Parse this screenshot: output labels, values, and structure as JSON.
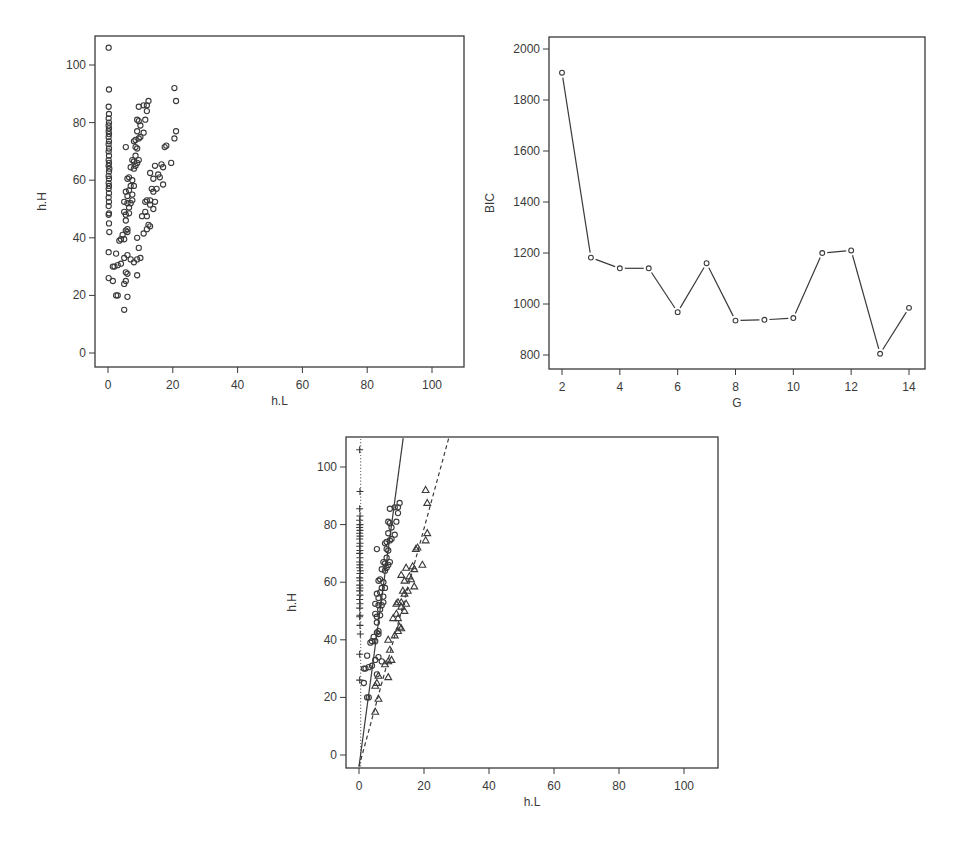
{
  "chart_data": [
    {
      "id": "scatter_raw",
      "type": "scatter",
      "title": "",
      "xlabel": "h.L",
      "ylabel": "h.H",
      "xlim": [
        -3,
        110
      ],
      "ylim": [
        -5,
        110
      ],
      "xticks": [
        0,
        20,
        40,
        60,
        80,
        100
      ],
      "yticks": [
        0,
        20,
        40,
        60,
        80,
        100
      ],
      "grid": false,
      "marker": "circle",
      "points_ref": "clusters"
    },
    {
      "id": "bic_curve",
      "type": "line",
      "title": "",
      "xlabel": "G",
      "ylabel": "BIC",
      "xlim": [
        1.6,
        14.5
      ],
      "ylim": [
        750,
        2050
      ],
      "xticks": [
        2,
        4,
        6,
        8,
        10,
        12,
        14
      ],
      "yticks": [
        800,
        1000,
        1200,
        1400,
        1600,
        1800,
        2000
      ],
      "grid": false,
      "marker": "circle",
      "x": [
        2,
        3,
        4,
        5,
        6,
        7,
        8,
        9,
        10,
        11,
        12,
        13,
        14
      ],
      "values": [
        1907,
        1182,
        1140,
        1140,
        968,
        1160,
        935,
        938,
        945,
        1200,
        1210,
        805,
        985
      ]
    },
    {
      "id": "scatter_clustered",
      "type": "scatter",
      "title": "",
      "xlabel": "h.L",
      "ylabel": "h.H",
      "xlim": [
        -3,
        110
      ],
      "ylim": [
        -5,
        110
      ],
      "xticks": [
        0,
        20,
        40,
        60,
        80,
        100
      ],
      "yticks": [
        0,
        20,
        40,
        60,
        80,
        100
      ],
      "grid": false,
      "series": [
        {
          "name": "cluster 1",
          "marker": "plus",
          "line": {
            "style": "dotted",
            "from": [
              0.5,
              -4
            ],
            "to": [
              0.5,
              110
            ]
          }
        },
        {
          "name": "cluster 2",
          "marker": "circle",
          "line": {
            "style": "solid",
            "from": [
              0,
              -4
            ],
            "to": [
              13.6,
              110
            ]
          }
        },
        {
          "name": "cluster 3",
          "marker": "triangle",
          "line": {
            "style": "dashed",
            "from": [
              0,
              -4
            ],
            "to": [
              27.6,
              110
            ]
          }
        }
      ],
      "points_ref": "clusters"
    }
  ],
  "clusters": {
    "plus": [
      [
        0.2,
        106
      ],
      [
        0.3,
        91.5
      ],
      [
        0.2,
        85.5
      ],
      [
        0.3,
        83
      ],
      [
        0.2,
        81.5
      ],
      [
        0.3,
        80
      ],
      [
        0.2,
        79
      ],
      [
        0.3,
        78
      ],
      [
        0.2,
        77
      ],
      [
        0.3,
        76
      ],
      [
        0.2,
        75
      ],
      [
        0.3,
        73.5
      ],
      [
        0.2,
        72.5
      ],
      [
        0.3,
        71
      ],
      [
        0.2,
        70
      ],
      [
        0.3,
        68.5
      ],
      [
        0.2,
        67
      ],
      [
        0.3,
        66
      ],
      [
        0.2,
        65
      ],
      [
        0.4,
        64
      ],
      [
        0.3,
        63
      ],
      [
        0.2,
        61.5
      ],
      [
        0.3,
        60.5
      ],
      [
        0.2,
        59
      ],
      [
        0.3,
        58
      ],
      [
        0.2,
        57
      ],
      [
        0.3,
        55.5
      ],
      [
        0.2,
        54
      ],
      [
        0.3,
        52.5
      ],
      [
        0.2,
        51
      ],
      [
        0.3,
        48.5
      ],
      [
        0.2,
        48
      ],
      [
        0.3,
        45
      ],
      [
        0.4,
        42
      ],
      [
        0.2,
        35
      ],
      [
        0.2,
        26
      ]
    ],
    "circle": [
      [
        12.5,
        87.5
      ],
      [
        11,
        86
      ],
      [
        12,
        86
      ],
      [
        9.5,
        85.5
      ],
      [
        12,
        84
      ],
      [
        11.5,
        81
      ],
      [
        9,
        81
      ],
      [
        9.5,
        80.5
      ],
      [
        10,
        79
      ],
      [
        11,
        76.5
      ],
      [
        9,
        77
      ],
      [
        8.5,
        74
      ],
      [
        9.5,
        74.5
      ],
      [
        10,
        75
      ],
      [
        8,
        73.5
      ],
      [
        9,
        71
      ],
      [
        8.5,
        71.5
      ],
      [
        5.5,
        71.5
      ],
      [
        8.5,
        68.5
      ],
      [
        7.5,
        67
      ],
      [
        8,
        66.5
      ],
      [
        9,
        66
      ],
      [
        8.5,
        65
      ],
      [
        7,
        64.5
      ],
      [
        9.5,
        67
      ],
      [
        8,
        64
      ],
      [
        6,
        60.5
      ],
      [
        6.5,
        61
      ],
      [
        7.5,
        60
      ],
      [
        7,
        58
      ],
      [
        8,
        58
      ],
      [
        5.5,
        56
      ],
      [
        6.5,
        56.5
      ],
      [
        7.5,
        55
      ],
      [
        6,
        54.5
      ],
      [
        7.5,
        53
      ],
      [
        6,
        52
      ],
      [
        7,
        52
      ],
      [
        5,
        52.5
      ],
      [
        6.5,
        50.5
      ],
      [
        5,
        49
      ],
      [
        5.5,
        48
      ],
      [
        6.5,
        48.5
      ],
      [
        5.5,
        46
      ],
      [
        6,
        43
      ],
      [
        5.5,
        42.5
      ],
      [
        6,
        42
      ],
      [
        4.5,
        41
      ],
      [
        3.5,
        39
      ],
      [
        4,
        39.5
      ],
      [
        5,
        39.5
      ],
      [
        2.5,
        34.5
      ],
      [
        6,
        34
      ],
      [
        5,
        33
      ],
      [
        7,
        32.5
      ],
      [
        3,
        30.5
      ],
      [
        2,
        30
      ],
      [
        1.5,
        30
      ],
      [
        4,
        31
      ],
      [
        5.5,
        28
      ],
      [
        1.5,
        25
      ],
      [
        3,
        20
      ],
      [
        2.5,
        20
      ]
    ],
    "triangle": [
      [
        20.5,
        92
      ],
      [
        21,
        87.5
      ],
      [
        21,
        77
      ],
      [
        20.5,
        74.5
      ],
      [
        18,
        72
      ],
      [
        17.5,
        71.5
      ],
      [
        19.5,
        66
      ],
      [
        16.5,
        65.5
      ],
      [
        14.5,
        65
      ],
      [
        17,
        64.5
      ],
      [
        13,
        62.5
      ],
      [
        15.5,
        62
      ],
      [
        16,
        61
      ],
      [
        14,
        60.5
      ],
      [
        17,
        58.5
      ],
      [
        13.5,
        57
      ],
      [
        15,
        57
      ],
      [
        14,
        56
      ],
      [
        12,
        53
      ],
      [
        11.5,
        52.5
      ],
      [
        13,
        53
      ],
      [
        14.5,
        52.5
      ],
      [
        13,
        51.5
      ],
      [
        14,
        50
      ],
      [
        11.5,
        49
      ],
      [
        12,
        47.5
      ],
      [
        10.5,
        47.5
      ],
      [
        12.5,
        44.5
      ],
      [
        13,
        44
      ],
      [
        12,
        43
      ],
      [
        11,
        41.5
      ],
      [
        9,
        40
      ],
      [
        9.5,
        36.5
      ],
      [
        10,
        33
      ],
      [
        9,
        32.5
      ],
      [
        8,
        31.5
      ],
      [
        9,
        27
      ],
      [
        6,
        27.5
      ],
      [
        5.5,
        25
      ],
      [
        5,
        24
      ],
      [
        6,
        19.5
      ],
      [
        5,
        15
      ]
    ]
  }
}
